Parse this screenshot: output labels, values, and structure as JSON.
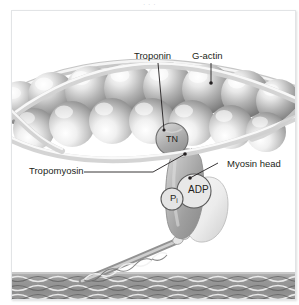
{
  "figure": {
    "top_caption_fragment": "· · ·"
  },
  "labels": {
    "troponin": "Troponin",
    "g_actin": "G-actin",
    "tropomyosin": "Tropomyosin",
    "myosin_head": "Myosin head"
  },
  "molecule_labels": {
    "tn": "TN",
    "adp": "ADP",
    "pi_symbol": "P",
    "pi_subscript": "i"
  },
  "colors": {
    "background": "#ffffff",
    "frame_border": "#e2e4e6",
    "text": "#231f20",
    "leader_line": "#231f20",
    "actin_sphere_light": "#f2f2f2",
    "actin_sphere_mid": "#b9b9b9",
    "actin_sphere_dark": "#8a8a8a",
    "tropomyosin_strand": "#d8d8d8",
    "myosin_head_front": "#a9a9a9",
    "myosin_head_back": "#ececec",
    "thick_filament": "#9d9d9d",
    "thick_filament_dark": "#6e6e6e"
  },
  "structure": {
    "actin_rows": 2,
    "actin_spheres_top_row": 7,
    "actin_spheres_bottom_row": 6,
    "troponin_markers": 1,
    "myosin_heads": 1,
    "thick_filament_position": "bottom"
  }
}
